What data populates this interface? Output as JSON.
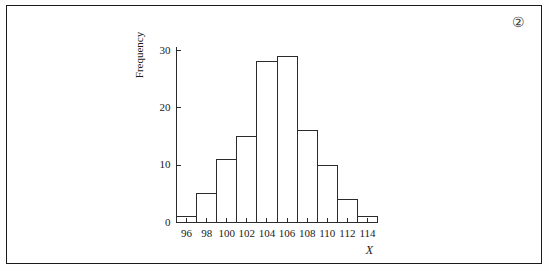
{
  "figure": {
    "marker_label": "②",
    "marker_name": "figure-number-2"
  },
  "chart_data": {
    "type": "bar",
    "title": "",
    "subtitle": "",
    "xlabel": "X",
    "ylabel": "Frequency",
    "categories": [
      "95-97",
      "97-99",
      "99-101",
      "101-103",
      "103-105",
      "105-107",
      "107-109",
      "109-111",
      "111-113",
      "113-115"
    ],
    "bin_edges": [
      95,
      97,
      99,
      101,
      103,
      105,
      107,
      109,
      111,
      113,
      115
    ],
    "values": [
      1,
      5,
      11,
      15,
      28,
      29,
      16,
      10,
      4,
      1
    ],
    "xlim": [
      95,
      115
    ],
    "ylim": [
      0,
      31
    ],
    "xticks": [
      96,
      98,
      100,
      102,
      104,
      106,
      108,
      110,
      112,
      114
    ],
    "xtick_labels": [
      "96",
      "98",
      "100",
      "102",
      "104",
      "106",
      "108",
      "110",
      "112",
      "114"
    ],
    "yticks": [
      0,
      10,
      20,
      30
    ],
    "ytick_labels": [
      "0",
      "10",
      "20",
      "30"
    ],
    "grid": false,
    "legend": null,
    "bar_fill": "#ffffff",
    "bar_edge": "#2b2b2b",
    "axis_color": "#2b2b2b"
  }
}
